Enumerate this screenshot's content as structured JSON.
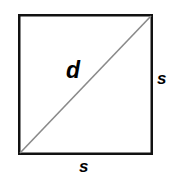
{
  "figure": {
    "canvas": {
      "width": 175,
      "height": 181,
      "background_color": "#ffffff"
    },
    "shapes": {
      "square": {
        "name": "square",
        "left": 18,
        "top": 14,
        "right": 153,
        "bottom": 155,
        "width": 135,
        "height": 141,
        "stroke_color": "#111111",
        "stroke_width": 2.5,
        "fill_color": "#ffffff"
      },
      "diagonal": {
        "name": "diagonal-line",
        "x1": 20,
        "y1": 153,
        "x2": 151,
        "y2": 16,
        "stroke_color": "#8a8a8a",
        "stroke_width": 1.6
      }
    },
    "labels": {
      "diagonal": "d",
      "side_right": "s",
      "side_bottom": "s"
    }
  }
}
